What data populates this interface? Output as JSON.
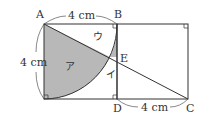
{
  "figure": {
    "points": {
      "A": "A",
      "B": "B",
      "C": "C",
      "D": "D",
      "E": "E"
    },
    "regions": {
      "a": "ア",
      "i": "イ",
      "u": "ウ"
    },
    "dimensions": {
      "ab": "4 cm",
      "left_side": "4 cm",
      "dc": "4 cm"
    },
    "colors": {
      "shade": "#b8b8b8",
      "line": "#333333"
    }
  }
}
